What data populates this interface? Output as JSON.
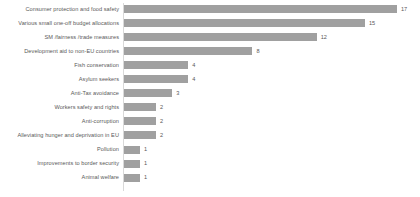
{
  "chart_data": {
    "type": "bar",
    "orientation": "horizontal",
    "title": "",
    "xlabel": "",
    "ylabel": "",
    "grid": false,
    "legend": false,
    "axis_line": true,
    "xlim": [
      0,
      17
    ],
    "value_labels": true,
    "bar_color": "#a0a0a0",
    "text_color": "#595959",
    "categories": [
      "Consumer protection and food safety",
      "Various small one-off budget allocations",
      "SM /fairness /trade measures",
      "Development aid to non-EU countries",
      "Fish conservation",
      "Asylum seekers",
      "Anti-Tax avoidance",
      "Workers safety and rights",
      "Anti-corruption",
      "Alleviating hunger and deprivation in EU",
      "Pollution",
      "Improvements to border security",
      "Animal welfare"
    ],
    "values": [
      17,
      15,
      12,
      8,
      4,
      4,
      3,
      2,
      2,
      2,
      1,
      1,
      1
    ],
    "value_label_texts": [
      "17",
      "15",
      "12",
      "8",
      "4",
      "4",
      "3",
      "2",
      "2",
      "2",
      "1",
      "1",
      "1"
    ]
  }
}
